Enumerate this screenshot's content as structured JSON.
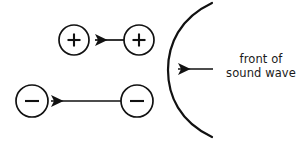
{
  "figure": {
    "background_color": "#ffffff",
    "stroke_color": "#111111",
    "width": 308,
    "height": 142
  },
  "labels": {
    "wave_front_line1": "front of",
    "wave_front_line2": "sound wave"
  },
  "particles": [
    {
      "name": "plus-particle-left",
      "sign": "+",
      "cx": 74,
      "cy": 40,
      "r": 15
    },
    {
      "name": "plus-particle-right",
      "sign": "+",
      "cx": 139,
      "cy": 40,
      "r": 15
    },
    {
      "name": "minus-particle-left",
      "sign": "−",
      "cx": 32,
      "cy": 101,
      "r": 16
    },
    {
      "name": "minus-particle-right",
      "sign": "−",
      "cx": 137,
      "cy": 101,
      "r": 16
    }
  ],
  "arrows": [
    {
      "name": "plus-motion-arrow",
      "x1": 124,
      "y1": 40,
      "x2": 93,
      "y2": 40,
      "direction": "left"
    },
    {
      "name": "wave-front-arrow",
      "x1": 213,
      "y1": 69,
      "x2": 176,
      "y2": 69,
      "direction": "left"
    },
    {
      "name": "minus-motion-arrow",
      "x1": 121,
      "y1": 101,
      "x2": 49,
      "y2": 101,
      "direction": "left"
    }
  ],
  "wave_arc": {
    "name": "sound-wave-front-arc",
    "top_x": 212,
    "top_y": 3,
    "apex_x": 168,
    "apex_y": 70,
    "bottom_x": 212,
    "bottom_y": 137
  }
}
